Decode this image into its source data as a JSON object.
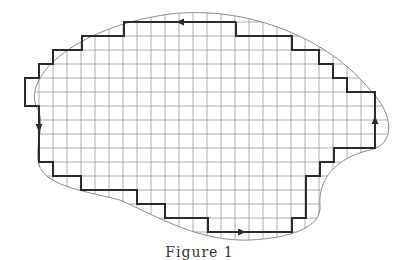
{
  "figure": {
    "caption": "Figure 1",
    "grid": {
      "cell_size": 14,
      "origin_x": 25,
      "origin_y": 22,
      "cols": 25,
      "rows": 16,
      "x_start": 25,
      "x_end": 375,
      "y_start": 8,
      "y_end": 246
    },
    "colors": {
      "grid": "#9a9a9a",
      "path": "#2b2b2b",
      "boundary": "#8c8c8c",
      "background": "#ffffff"
    },
    "boundary_curve": "M 38 110 C 20 80, 70 28, 170 14 C 250 5, 330 40, 370 90 C 395 115, 395 145, 370 150 C 335 158, 318 180, 320 205 C 322 228, 290 238, 250 240 C 200 242, 160 218, 120 200 C 80 190, 40 185, 38 160 C 36 140, 45 125, 38 110 Z",
    "path_points": [
      [
        236,
        22
      ],
      [
        124,
        22
      ],
      [
        124,
        36
      ],
      [
        82,
        36
      ],
      [
        82,
        50
      ],
      [
        53,
        50
      ],
      [
        53,
        64
      ],
      [
        39,
        64
      ],
      [
        39,
        78
      ],
      [
        25,
        78
      ],
      [
        25,
        106
      ],
      [
        39,
        106
      ],
      [
        39,
        162
      ],
      [
        53,
        162
      ],
      [
        53,
        176
      ],
      [
        81,
        176
      ],
      [
        81,
        190
      ],
      [
        137,
        190
      ],
      [
        137,
        204
      ],
      [
        165,
        204
      ],
      [
        165,
        218
      ],
      [
        208,
        218
      ],
      [
        208,
        232
      ],
      [
        292,
        232
      ],
      [
        292,
        218
      ],
      [
        306,
        218
      ],
      [
        306,
        176
      ],
      [
        320,
        176
      ],
      [
        320,
        162
      ],
      [
        334,
        162
      ],
      [
        334,
        148
      ],
      [
        375,
        148
      ],
      [
        375,
        92
      ],
      [
        347,
        92
      ],
      [
        347,
        78
      ],
      [
        333,
        78
      ],
      [
        333,
        64
      ],
      [
        319,
        64
      ],
      [
        319,
        50
      ],
      [
        292,
        50
      ],
      [
        292,
        36
      ],
      [
        236,
        36
      ],
      [
        236,
        22
      ]
    ],
    "arrows": [
      {
        "name": "arrow-top-left",
        "x": 180,
        "y": 22,
        "direction": "left"
      },
      {
        "name": "arrow-left-down",
        "x": 39,
        "y": 128,
        "direction": "down"
      },
      {
        "name": "arrow-bottom-right",
        "x": 242,
        "y": 232,
        "direction": "right"
      },
      {
        "name": "arrow-right-up",
        "x": 375,
        "y": 120,
        "direction": "up"
      }
    ]
  }
}
